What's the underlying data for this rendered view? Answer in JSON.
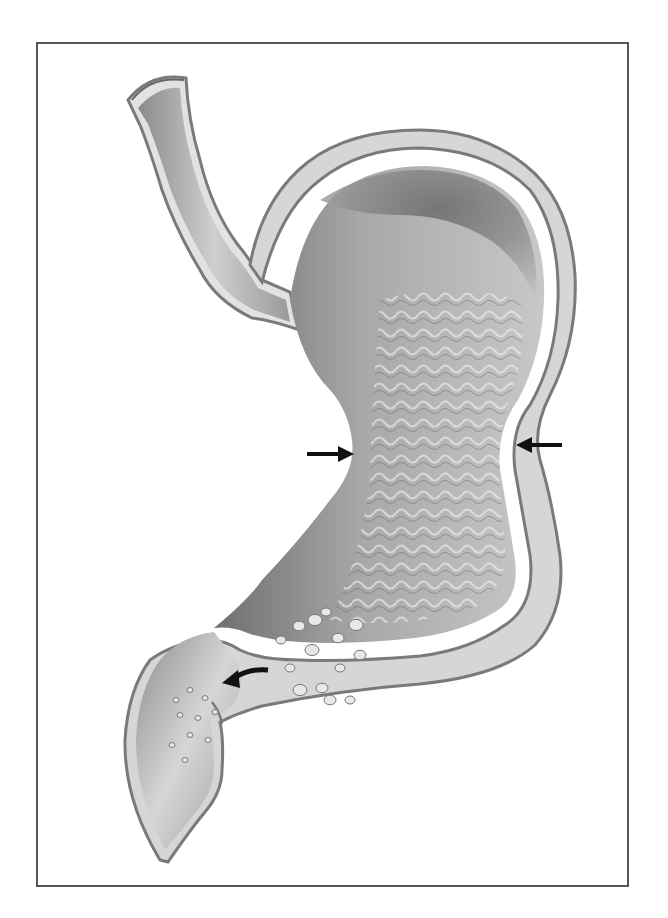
{
  "figure": {
    "frame": {
      "x": 36,
      "y": 42,
      "width": 593,
      "height": 845,
      "border_color": "#555555"
    },
    "colors": {
      "background": "#ffffff",
      "wall_outer": "#8a8a8a",
      "wall_fill": "#d8d8d8",
      "lumen_dark": "#6e6e6e",
      "lumen_mid": "#9a9a9a",
      "lumen_light": "#c9c9c9",
      "arrow": "#111111"
    },
    "arrows": [
      {
        "name": "constriction-left-arrow",
        "from": [
          307,
          454
        ],
        "to": [
          352,
          454
        ],
        "direction": "right"
      },
      {
        "name": "constriction-right-arrow",
        "from": [
          562,
          445
        ],
        "to": [
          517,
          445
        ],
        "direction": "left"
      },
      {
        "name": "pylorus-curved-arrow",
        "from": [
          268,
          672
        ],
        "to": [
          222,
          681
        ],
        "direction": "left-curved"
      }
    ],
    "particles": [
      [
        281,
        640
      ],
      [
        299,
        626
      ],
      [
        312,
        650
      ],
      [
        326,
        612
      ],
      [
        338,
        638
      ],
      [
        356,
        625
      ],
      [
        340,
        668
      ],
      [
        322,
        688
      ],
      [
        300,
        690
      ],
      [
        350,
        700
      ],
      [
        360,
        655
      ],
      [
        315,
        620
      ],
      [
        290,
        668
      ],
      [
        330,
        700
      ],
      [
        176,
        700
      ],
      [
        190,
        690
      ],
      [
        205,
        698
      ],
      [
        180,
        715
      ],
      [
        198,
        718
      ],
      [
        215,
        712
      ],
      [
        190,
        735
      ],
      [
        208,
        740
      ],
      [
        172,
        745
      ],
      [
        185,
        760
      ]
    ]
  }
}
